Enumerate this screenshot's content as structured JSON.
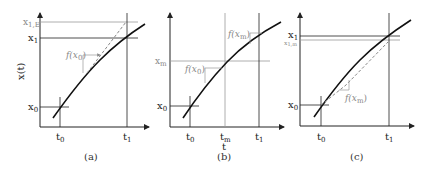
{
  "panels": [
    {
      "caption": "(a)",
      "y_axis_label": "x(t)",
      "y_labels": {
        "x1E": "x",
        "x1E_sub": "1,E",
        "x1": "x",
        "x1_sub": "1",
        "x0": "x",
        "x0_sub": "0"
      },
      "t_labels": {
        "t0": "t",
        "t0_sub": "0",
        "t1": "t",
        "t1_sub": "1"
      },
      "slope_label": "f(x",
      "slope_label_sub": "0",
      "slope_label_close": ")"
    },
    {
      "caption": "(b)",
      "x_axis_label": "t",
      "y_labels": {
        "xm": "x",
        "xm_sub": "m",
        "x0": "x",
        "x0_sub": "0"
      },
      "t_labels": {
        "t0": "t",
        "t0_sub": "0",
        "tm": "t",
        "tm_sub": "m",
        "t1": "t",
        "t1_sub": "1"
      },
      "slope_labels": [
        {
          "text": "f(x",
          "sub": "0",
          "close": ")"
        },
        {
          "text": "f(x",
          "sub": "m",
          "close": ")"
        }
      ]
    },
    {
      "caption": "(c)",
      "y_labels": {
        "x1": "x",
        "x1_sub": "1",
        "x1m": "x",
        "x1m_sub": "1,m",
        "x0": "x",
        "x0_sub": "0"
      },
      "t_labels": {
        "t0": "t",
        "t0_sub": "0",
        "t1": "t",
        "t1_sub": "1"
      },
      "slope_label": "f(x",
      "slope_label_sub": "m",
      "slope_label_close": ")"
    }
  ],
  "colors": {
    "axis": "#222222",
    "curve": "#111111",
    "guide": "#999999",
    "dashed": "#888888"
  }
}
